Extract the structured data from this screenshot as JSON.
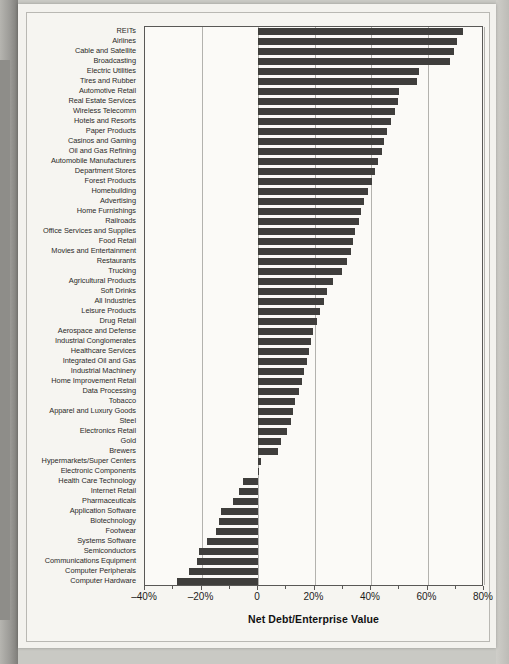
{
  "chart_data": {
    "type": "bar",
    "orientation": "horizontal",
    "title": "",
    "xlabel": "Net Debt/Enterprise Value",
    "ylabel": "",
    "xlim": [
      -40,
      80
    ],
    "xticks": [
      -40,
      -20,
      0,
      20,
      40,
      60,
      80
    ],
    "xticklabels": [
      "–40%",
      "–20%",
      "0",
      "20%",
      "40%",
      "60%",
      "80%"
    ],
    "grid": true,
    "legend": null,
    "bar_color": "#3f3e3c",
    "categories": [
      "REITs",
      "Airlines",
      "Cable and Satellite",
      "Broadcasting",
      "Electric Utilities",
      "Tires and Rubber",
      "Automotive Retail",
      "Real Estate Services",
      "Wireless Telecomm",
      "Hotels and Resorts",
      "Paper Products",
      "Casinos and Gaming",
      "Oil and Gas Refining",
      "Automobile Manufacturers",
      "Department Stores",
      "Forest Products",
      "Homebuilding",
      "Advertising",
      "Home Furnishings",
      "Railroads",
      "Office Services and Supplies",
      "Food Retail",
      "Movies and Entertainment",
      "Restaurants",
      "Trucking",
      "Agricultural Products",
      "Soft Drinks",
      "All Industries",
      "Leisure Products",
      "Drug Retail",
      "Aerospace and Defense",
      "Industrial Conglomerates",
      "Healthcare Services",
      "Integrated Oil and Gas",
      "Industrial Machinery",
      "Home Improvement Retail",
      "Data Processing",
      "Tobacco",
      "Apparel and Luxury Goods",
      "Steel",
      "Electronics Retail",
      "Gold",
      "Brewers",
      "Hypermarkets/Super Centers",
      "Electronic Components",
      "Health Care Technology",
      "Internet Retail",
      "Pharmaceuticals",
      "Application Software",
      "Biotechnology",
      "Footwear",
      "Systems Software",
      "Semiconductors",
      "Communications Equipment",
      "Computer Peripherals",
      "Computer Hardware"
    ],
    "values": [
      72.6,
      70.3,
      69.5,
      68.0,
      57.0,
      56.2,
      50.0,
      49.6,
      48.4,
      47.2,
      45.8,
      44.6,
      43.8,
      42.4,
      41.4,
      40.2,
      38.8,
      37.6,
      36.6,
      35.6,
      34.4,
      33.6,
      32.8,
      31.4,
      29.6,
      26.6,
      24.6,
      23.2,
      22.0,
      21.0,
      19.6,
      18.8,
      18.0,
      17.2,
      16.4,
      15.6,
      14.4,
      13.2,
      12.4,
      11.6,
      10.2,
      8.0,
      7.0,
      1.2,
      0.4,
      -5.2,
      -6.6,
      -9.0,
      -13.2,
      -13.8,
      -15.0,
      -18.0,
      -21.0,
      -21.6,
      -24.6,
      -28.5
    ]
  },
  "page": {
    "smudge_top": "",
    "smudge_bottom_1": "",
    "smudge_bottom_2": ""
  }
}
